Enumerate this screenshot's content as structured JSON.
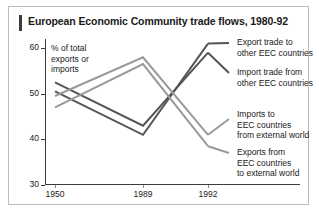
{
  "figure": {
    "title": "European Economic Community trade flows, 1980-92",
    "axis_caption": "% of total\nexports or\nimports",
    "axis_caption_lines": [
      "% of total",
      "exports or",
      "imports"
    ],
    "colors": {
      "dark_series": "#555555",
      "light_series": "#9a9a9a",
      "axis": "#3c3c3c",
      "border": "#bdbdbd",
      "background": "#ffffff",
      "text": "#1a1a1a"
    }
  },
  "chart_data": {
    "type": "line",
    "title": "European Economic Community trade flows, 1980-92",
    "xlabel": "",
    "ylabel": "% of total exports or imports",
    "x": [
      "1950",
      "1989",
      "1992"
    ],
    "xticks": [
      "1950",
      "1989",
      "1992"
    ],
    "yticks": [
      30,
      40,
      50,
      60
    ],
    "ylim": [
      30,
      62
    ],
    "grid": false,
    "legend_position": "right",
    "series": [
      {
        "name": "Export trade to other EEC countries",
        "color": "#555555",
        "values": [
          50.5,
          41.0,
          61.0
        ]
      },
      {
        "name": "Import trade from other EEC countries",
        "color": "#555555",
        "values": [
          52.5,
          43.0,
          59.0
        ]
      },
      {
        "name": "Imports to EEC countries from external world",
        "color": "#9a9a9a",
        "values": [
          49.5,
          58.0,
          41.0
        ]
      },
      {
        "name": "Exports from EEC countries to external world",
        "color": "#9a9a9a",
        "values": [
          47.0,
          56.5,
          38.5
        ]
      }
    ]
  },
  "legend": {
    "entries": [
      {
        "lines": [
          "Export trade to",
          "other EEC countries"
        ],
        "color": "#555555"
      },
      {
        "lines": [
          "Import trade from",
          "other EEC countries"
        ],
        "color": "#555555"
      },
      {
        "lines": [
          "Imports to",
          "EEC countries",
          "from external world"
        ],
        "color": "#9a9a9a"
      },
      {
        "lines": [
          "Exports from",
          "EEC countries",
          "to external world"
        ],
        "color": "#9a9a9a"
      }
    ]
  }
}
